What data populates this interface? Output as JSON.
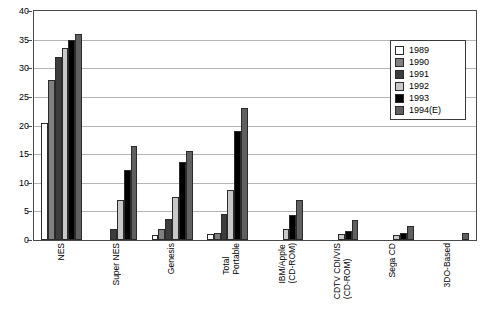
{
  "chart_data": {
    "type": "bar",
    "title": "",
    "xlabel": "",
    "ylabel": "",
    "ylim": [
      0,
      40
    ],
    "ytick_step": 5,
    "yticks": [
      "0",
      "5",
      "10",
      "15",
      "20",
      "25",
      "30",
      "35",
      "40"
    ],
    "grid": true,
    "legend_position": "top-right",
    "categories": [
      "NES",
      "Super NES",
      "Genesis",
      "Total Portable",
      "IBM/Apple (CD-ROM)",
      "CDTV CDI/VIS (CD-ROM)",
      "Sega CD",
      "3DO-Based"
    ],
    "category_lines": [
      [
        "NES"
      ],
      [
        "Super NES"
      ],
      [
        "Genesis"
      ],
      [
        "Total",
        "Portable"
      ],
      [
        "IBM/Apple",
        "(CD-ROM)"
      ],
      [
        "CDTV CDI/VIS",
        "(CD-ROM)"
      ],
      [
        "Sega CD"
      ],
      [
        "3DO-Based"
      ]
    ],
    "series": [
      {
        "name": "1989",
        "color": "#ffffff",
        "values": [
          20.5,
          0,
          0.8,
          1.0,
          0,
          0,
          0,
          0
        ]
      },
      {
        "name": "1990",
        "color": "#808080",
        "values": [
          28.0,
          0,
          2.0,
          1.2,
          0,
          0,
          0,
          0
        ]
      },
      {
        "name": "1991",
        "color": "#3d3d3d",
        "values": [
          32.0,
          2.0,
          3.6,
          4.5,
          0,
          0,
          0,
          0
        ]
      },
      {
        "name": "1992",
        "color": "#c8c8c8",
        "values": [
          33.5,
          7.0,
          7.5,
          8.7,
          2.0,
          1.0,
          0.8,
          0
        ]
      },
      {
        "name": "1993",
        "color": "#000000",
        "values": [
          35.0,
          12.2,
          13.7,
          19.0,
          4.3,
          1.5,
          1.2,
          0
        ]
      },
      {
        "name": "1994(E)",
        "color": "#606060",
        "values": [
          36.0,
          16.5,
          15.5,
          23.0,
          7.0,
          3.5,
          2.5,
          1.2
        ]
      }
    ]
  },
  "legend": {
    "items": [
      {
        "label": "1989"
      },
      {
        "label": "1990"
      },
      {
        "label": "1991"
      },
      {
        "label": "1992"
      },
      {
        "label": "1993"
      },
      {
        "label": "1994(E)"
      }
    ]
  }
}
